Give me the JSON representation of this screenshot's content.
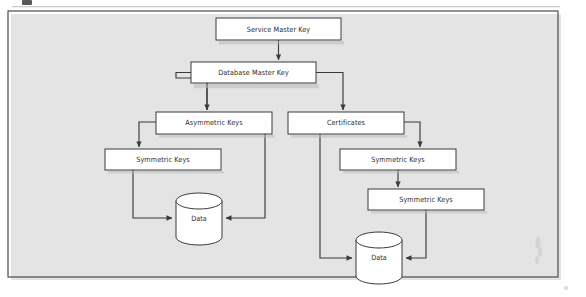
{
  "figure": {
    "type": "flowchart",
    "frame": {
      "border_color": "#4a4a4a",
      "background": "#ffffff"
    }
  },
  "nodes": [
    {
      "id": "service-master-key",
      "label": "Service Master Key",
      "shape": "rect",
      "x": 216,
      "y": 18,
      "w": 125,
      "h": 22
    },
    {
      "id": "database-master-key",
      "label": "Database Master Key",
      "shape": "rect",
      "x": 191,
      "y": 62,
      "w": 125,
      "h": 21
    },
    {
      "id": "asymmetric-keys",
      "label": "Asymmetric Keys",
      "shape": "rect",
      "x": 156,
      "y": 112,
      "w": 116,
      "h": 22
    },
    {
      "id": "certificates",
      "label": "Certificates",
      "shape": "rect",
      "x": 288,
      "y": 112,
      "w": 116,
      "h": 22
    },
    {
      "id": "symmetric-keys-left",
      "label": "Symmetric Keys",
      "shape": "rect",
      "x": 105,
      "y": 149,
      "w": 116,
      "h": 21
    },
    {
      "id": "symmetric-keys-right-1",
      "label": "Symmetric Keys",
      "shape": "rect",
      "x": 340,
      "y": 149,
      "w": 116,
      "h": 21
    },
    {
      "id": "symmetric-keys-right-2",
      "label": "Symmetric Keys",
      "shape": "rect",
      "x": 368,
      "y": 189,
      "w": 116,
      "h": 21
    },
    {
      "id": "data-left",
      "label": "Data",
      "shape": "cylinder",
      "x": 176,
      "y": 193,
      "w": 46,
      "h": 52
    },
    {
      "id": "data-right",
      "label": "Data",
      "shape": "cylinder",
      "x": 356,
      "y": 232,
      "w": 46,
      "h": 52
    }
  ],
  "edges": [
    {
      "id": "smk-to-dmk",
      "from": "service-master-key",
      "to": "database-master-key",
      "arrow": "down"
    },
    {
      "id": "dmk-to-asym",
      "from": "database-master-key",
      "to": "asymmetric-keys",
      "arrow": "down"
    },
    {
      "id": "dmk-to-cert",
      "from": "database-master-key",
      "to": "certificates",
      "arrow": "down"
    },
    {
      "id": "asym-to-symleft",
      "from": "asymmetric-keys",
      "to": "symmetric-keys-left",
      "arrow": "down"
    },
    {
      "id": "asym-to-dataleft",
      "from": "asymmetric-keys",
      "to": "data-left",
      "arrow": "left"
    },
    {
      "id": "symleft-to-data",
      "from": "symmetric-keys-left",
      "to": "data-left",
      "arrow": "right"
    },
    {
      "id": "cert-to-dataright",
      "from": "certificates",
      "to": "data-right",
      "arrow": "right"
    },
    {
      "id": "cert-to-symright",
      "from": "certificates",
      "to": "symmetric-keys-right-1",
      "arrow": "down"
    },
    {
      "id": "symright1-to-2",
      "from": "symmetric-keys-right-1",
      "to": "symmetric-keys-right-2",
      "arrow": "down"
    },
    {
      "id": "symright2-to-data",
      "from": "symmetric-keys-right-2",
      "to": "data-right",
      "arrow": "left"
    }
  ]
}
